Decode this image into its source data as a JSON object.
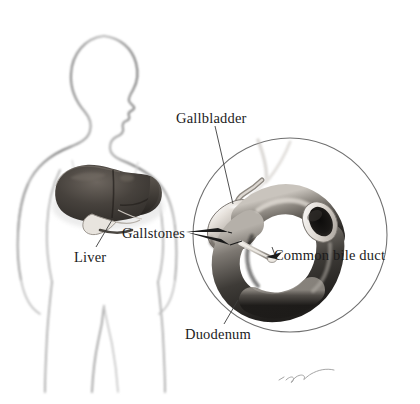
{
  "figure": {
    "kind": "medical-anatomical-illustration",
    "style": "grayscale airbrush rendering on white background",
    "width": 420,
    "height": 404
  },
  "labels": {
    "gallbladder": "Gallbladder",
    "gallstones": "Gallstones",
    "common_bile_duct": "Common bile duct",
    "duodenum": "Duodenum",
    "liver": "Liver"
  },
  "signature": {
    "text": "artist-signature",
    "visible": true
  },
  "caption": {
    "text": ""
  },
  "colors": {
    "background": "#ffffff",
    "body_outline": "#8e8e8e",
    "body_outline_dark": "#5a5a5a",
    "liver_dark": "#3a3632",
    "liver_mid": "#55504a",
    "liver_light": "#6e6862",
    "organ_dark": "#2f2d2b",
    "organ_mid": "#6b6762",
    "organ_light": "#cfcac4",
    "organ_highlight": "#f0ece7",
    "gallstone": "#15120f",
    "circle_stroke": "#6f6f6f",
    "leader_line": "#3c3c3c",
    "label_text": "#1c1c1c"
  },
  "parts": {
    "body": "human torso silhouette, head in right-facing profile, shoulders, arms, waist and upper legs",
    "liver_position": "upper abdomen, left of center",
    "inset": "circular magnification showing gallbladder, cystic duct, common bile duct, gallstones and C-shaped duodenum with cut open end"
  }
}
